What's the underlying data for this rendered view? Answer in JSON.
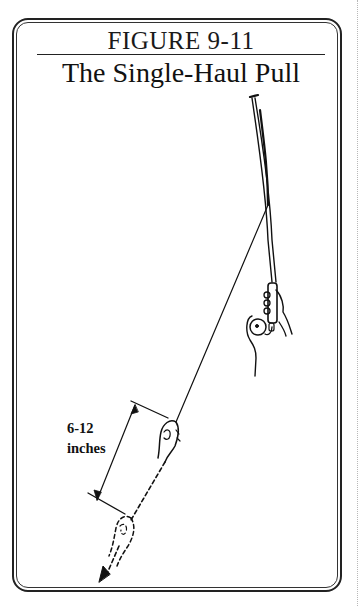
{
  "figure": {
    "number": "FIGURE 9-11",
    "title": "The Single-Haul Pull"
  },
  "annotation": {
    "distance_line1": "6-12",
    "distance_line2": "inches"
  },
  "illustration": {
    "subject": "fly-fishing-rod-single-haul",
    "elements": [
      "fly-rod",
      "rod-hand-with-reel",
      "fly-line",
      "line-hand",
      "ghost-line-hand-dashed",
      "pull-direction-arrow",
      "dimension-arrow"
    ]
  },
  "colors": {
    "ink": "#111111",
    "paper": "#ffffff"
  }
}
